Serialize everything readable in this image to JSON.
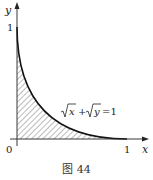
{
  "figure": {
    "caption": "图 44",
    "axes": {
      "x_label": "x",
      "y_label": "y",
      "origin_label": "0",
      "x_tick_label": "1",
      "y_tick_label": "1"
    },
    "curve_equation": {
      "sqrt1": "x",
      "plus": "+",
      "sqrt2": "y",
      "equals": "=1"
    },
    "shading": "hatched region under curve √x+√y=1 in first quadrant",
    "colors": {
      "ink": "#222222",
      "hatch": "#555555",
      "background": "#ffffff"
    }
  }
}
